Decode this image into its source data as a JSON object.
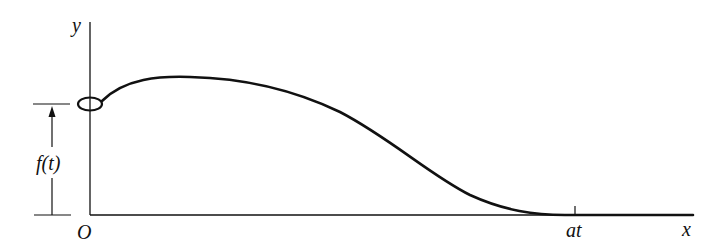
{
  "diagram": {
    "axes": {
      "x_label": "x",
      "y_label": "y",
      "origin_label": "O"
    },
    "tick_label": "at",
    "dimension_label": "f(t)",
    "curve_description": "Profile of displaced string/wave: starts at height f(t) on y-axis (small ellipse marks endpoint), rises to a maximum, then decreases smoothly to zero at x = at and stays zero afterward",
    "colors": {
      "line": "#111111",
      "background": "#ffffff"
    }
  }
}
